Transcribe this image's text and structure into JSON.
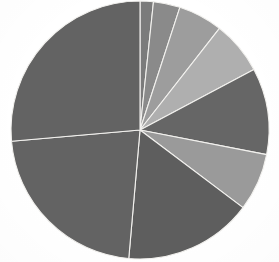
{
  "chart_data": {
    "type": "pie",
    "title": "",
    "subtitle": "",
    "xlabel": "",
    "ylabel": "",
    "legend": "none",
    "grid": false,
    "rendering": "grayscale scanned document",
    "start_angle_deg": 0,
    "direction": "clockwise",
    "center": {
      "x": 140,
      "y": 130
    },
    "radius": 129,
    "categories": [
      "Segment 1",
      "Segment 2",
      "Segment 3",
      "Segment 4",
      "Segment 5",
      "Segment 6",
      "Segment 7",
      "Segment 8",
      "Segment 9"
    ],
    "values": [
      1.7,
      3.3,
      5.6,
      6.7,
      10.8,
      7.2,
      16.1,
      22.2,
      26.4
    ],
    "value_unit": "percent",
    "angles_deg": [
      6,
      12,
      20,
      24,
      39,
      26,
      58,
      80,
      95
    ],
    "slices": [
      {
        "label": "Segment 1",
        "value": 1.7,
        "start_deg": 0,
        "end_deg": 6,
        "color": "#7b7b7b"
      },
      {
        "label": "Segment 2",
        "value": 3.3,
        "start_deg": 6,
        "end_deg": 18,
        "color": "#8a8a8a"
      },
      {
        "label": "Segment 3",
        "value": 5.6,
        "start_deg": 18,
        "end_deg": 38,
        "color": "#9d9d9d"
      },
      {
        "label": "Segment 4",
        "value": 6.7,
        "start_deg": 38,
        "end_deg": 62,
        "color": "#afafaf"
      },
      {
        "label": "Segment 5",
        "value": 10.8,
        "start_deg": 62,
        "end_deg": 101,
        "color": "#666666"
      },
      {
        "label": "Segment 6",
        "value": 7.2,
        "start_deg": 101,
        "end_deg": 127,
        "color": "#9a9a9a"
      },
      {
        "label": "Segment 7",
        "value": 16.1,
        "start_deg": 127,
        "end_deg": 185,
        "color": "#5e5e5e"
      },
      {
        "label": "Segment 8",
        "value": 22.2,
        "start_deg": 185,
        "end_deg": 265,
        "color": "#636363"
      },
      {
        "label": "Segment 9",
        "value": 26.4,
        "start_deg": 265,
        "end_deg": 360,
        "color": "#636363"
      }
    ],
    "colors": {
      "background": "#ffffff",
      "separator": "#f2f1ee",
      "dark_gray": "#5e5e5e",
      "mid_gray": "#8a8a8a",
      "light_gray": "#afafaf"
    }
  }
}
